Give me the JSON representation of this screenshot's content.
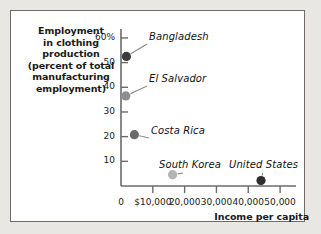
{
  "chart_data": {
    "type": "scatter",
    "title": "",
    "xlabel": "Income per capita",
    "ylabel": "Employment in clothing production (percent of total manufacturing employment)",
    "ylabel_lines": [
      "Employment",
      "in clothing",
      "production",
      "(percent of total",
      "manufacturing",
      "employment)"
    ],
    "xlim": [
      0,
      55000
    ],
    "ylim": [
      0,
      62
    ],
    "grid": false,
    "legend": "none",
    "xticks": [
      {
        "value": 0,
        "label": "0"
      },
      {
        "value": 10000,
        "label": "$10,000"
      },
      {
        "value": 20000,
        "label": "20,000"
      },
      {
        "value": 30000,
        "label": "30,000"
      },
      {
        "value": 40000,
        "label": "40,000"
      },
      {
        "value": 50000,
        "label": "50,000"
      }
    ],
    "yticks": [
      {
        "value": 10,
        "label": "10"
      },
      {
        "value": 20,
        "label": "20"
      },
      {
        "value": 30,
        "label": "30"
      },
      {
        "value": 40,
        "label": "40"
      },
      {
        "value": 50,
        "label": "50"
      },
      {
        "value": 60,
        "label": "60%"
      }
    ],
    "points": [
      {
        "name": "Bangladesh",
        "x": 1700,
        "y": 52.5,
        "color": "#3b3b3b",
        "radius": 4.6
      },
      {
        "name": "El Salvador",
        "x": 1500,
        "y": 36.5,
        "color": "#8e8e8e",
        "radius": 4.6
      },
      {
        "name": "Costa Rica",
        "x": 4200,
        "y": 20.8,
        "color": "#6a6a6a",
        "radius": 4.6
      },
      {
        "name": "South Korea",
        "x": 16200,
        "y": 4.6,
        "color": "#b4b4b4",
        "radius": 4.6
      },
      {
        "name": "United States",
        "x": 44000,
        "y": 2.2,
        "color": "#2e2e2e",
        "radius": 4.6
      }
    ],
    "colors": {
      "axis": "#6b6b6b",
      "text": "#1a1a1a",
      "plot_background": "#ffffff",
      "page_background": "#e9e7e4",
      "frame_border": "#6e6a66",
      "leader_line": "#8a8a8a"
    }
  }
}
